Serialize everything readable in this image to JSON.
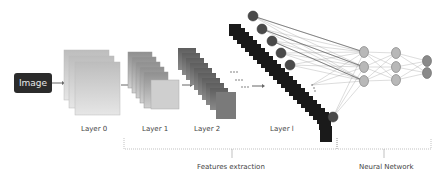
{
  "input": {
    "label": "Image"
  },
  "layers": [
    {
      "label": "Layer 0"
    },
    {
      "label": "Layer 1"
    },
    {
      "label": "Layer 2"
    },
    {
      "label": "Layer l"
    }
  ],
  "sections": {
    "features": "Features extraction",
    "network": "Neural Network"
  },
  "colors": {
    "input_box": "#2b2b2b",
    "layer0": "#c9c9c9",
    "layer1": "#a6a6a6",
    "layer2": "#6f6f6f",
    "layerl": "#1a1a1a",
    "feature_node": "#4a4a4a",
    "hidden_node": "#b8b8b8",
    "output_node": "#8a8a8a"
  }
}
